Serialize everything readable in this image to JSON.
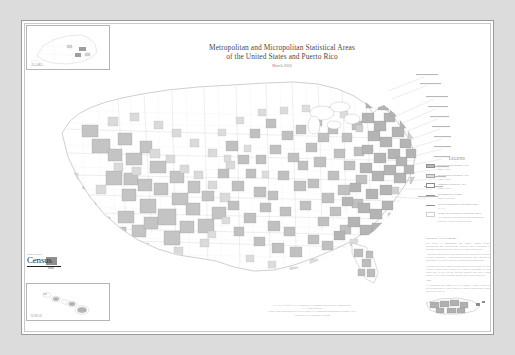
{
  "poster": {
    "title_line1": "Metropolitan and Micropolitan Statistical Areas",
    "title_line2": "of the United States and Puerto Rico",
    "date": "March 2020"
  },
  "legend": {
    "heading": "LEGEND",
    "items": [
      {
        "swatch": "metropolitan-statistical-area",
        "label": "Metropolitan Statistical Area",
        "sub": "Name of area"
      },
      {
        "swatch": "micropolitan-statistical-area",
        "label": "Micropolitan Statistical Area",
        "sub": "Name of area"
      },
      {
        "swatch": "combined-statistical-area",
        "label": "Combined Statistical Area",
        "sub": "Name of area"
      },
      {
        "swatch": "metropolitan-division",
        "label": "Metropolitan Division",
        "sub": "Name of division"
      },
      {
        "swatch": "state-boundary",
        "label": "State or Statistically Equivalent Entity",
        "sub": "TEXAS"
      },
      {
        "swatch": "county-boundary",
        "label": "County or Statistically Equivalent Entity",
        "sub": "Areas outside of Metropolitan and Micropolitan Statistical Areas are shown in white"
      }
    ]
  },
  "notes": {
    "heading": "Statistical Area Definitions",
    "paragraphs": [
      "The Office of Management and Budget (OMB) defines metropolitan and micropolitan statistical areas according to published standards that are applied to Census Bureau data.",
      "A metropolitan statistical area contains a core urban area of 50,000 or more population. A micropolitan statistical area contains an urban core of at least 10,000 but less than 50,000 population.",
      "Each metropolitan or micropolitan statistical area consists of one or more counties and includes the counties containing the core urban area, as well as any adjacent counties that have a high degree of social and economic integration with the urban core."
    ]
  },
  "notes2": {
    "heading": "Note",
    "paragraphs": [
      "All boundaries and names are as of January 1, 2020. Statistical area delineations are those issued by OMB in March 2020 (OMB Bulletin No. 20-01)."
    ]
  },
  "credit": {
    "lines": [
      "U.S. DEPARTMENT OF COMMERCE  Economics and Statistics Administration",
      "U.S. Census Bureau",
      "Source: 2020 OMB Bulletin No. 20-01 and U.S. Census Bureau geographic boundary files.",
      "Prepared by the Geography Division"
    ]
  },
  "insets": {
    "alaska": "ALASKA",
    "hawaii": "HAWAII",
    "puerto_rico": "PUERTO RICO"
  },
  "logo": {
    "top": "United States",
    "word": "Census",
    "suffix": "Bureau"
  },
  "colors": {
    "paper": "#ffffff",
    "backdrop": "#dcdcdc",
    "metro_fill": "#b9b9b9",
    "micro_fill": "#dcdcdc",
    "boundary": "#b0b0b0",
    "text": "#8d8d8d"
  }
}
